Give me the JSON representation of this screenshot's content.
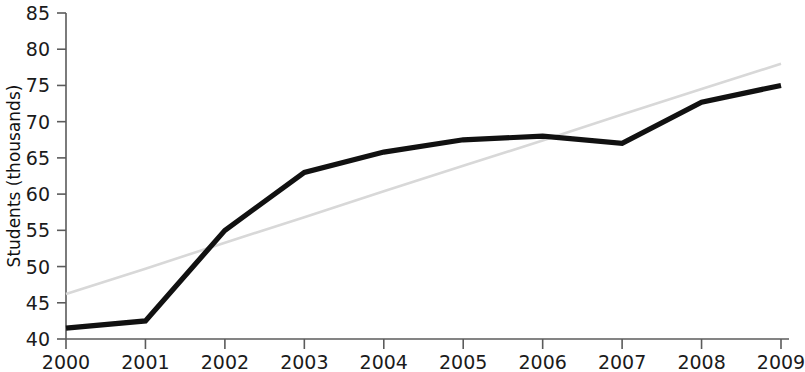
{
  "chart_data": {
    "type": "line",
    "title": "",
    "subtitle": "",
    "xlabel": "",
    "ylabel": "Students (thousands)",
    "categories": [
      "2000",
      "2001",
      "2002",
      "2003",
      "2004",
      "2005",
      "2006",
      "2007",
      "2008",
      "2009"
    ],
    "x": [
      2000,
      2001,
      2002,
      2003,
      2004,
      2005,
      2006,
      2007,
      2008,
      2009
    ],
    "xlim": [
      2000,
      2009
    ],
    "ylim": [
      40,
      85
    ],
    "ytick_labels": [
      "40",
      "45",
      "50",
      "55",
      "60",
      "65",
      "70",
      "75",
      "80",
      "85"
    ],
    "yticks": [
      40,
      45,
      50,
      55,
      60,
      65,
      70,
      75,
      80,
      85
    ],
    "xtick_labels": [
      "2000",
      "2001",
      "2002",
      "2003",
      "2004",
      "2005",
      "2006",
      "2007",
      "2008",
      "2009"
    ],
    "grid": false,
    "legend": null,
    "legend_position": "none",
    "annotations": [],
    "series": [
      {
        "name": "Students",
        "style": "solid",
        "color": "#111111",
        "values": [
          41.5,
          42.5,
          55.0,
          63.0,
          65.8,
          67.5,
          68.0,
          67.0,
          72.7,
          75.0
        ]
      },
      {
        "name": "Trend",
        "style": "solid-light",
        "color": "#d8d8d8",
        "values": [
          46.2,
          49.7,
          53.3,
          56.8,
          60.4,
          63.9,
          67.4,
          71.0,
          74.5,
          78.0
        ]
      }
    ]
  },
  "axes": {
    "y_axis_label": "Students (thousands)"
  }
}
